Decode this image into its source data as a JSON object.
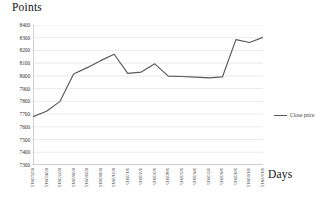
{
  "chart_data": {
    "type": "line",
    "title": "",
    "xlabel": "Days",
    "ylabel": "Points",
    "ylim": [
      7300,
      8400
    ],
    "ytick_step": 100,
    "yticks": [
      8400,
      8300,
      8200,
      8100,
      8000,
      7900,
      7800,
      7700,
      7600,
      7500,
      7400,
      7300
    ],
    "grid": true,
    "grid_axis": "y",
    "legend_position": "right",
    "categories": [
      "8/25/2015",
      "8/26/2015",
      "8/27/2015",
      "8/28/2015",
      "8/29/2015",
      "8/30/2015",
      "8/31/2015",
      "9/1/2015",
      "9/2/2015",
      "9/3/2015",
      "9/4/2015",
      "9/5/2015",
      "9/6/2015",
      "9/7/2015",
      "9/8/2015",
      "9/9/2015",
      "9/10/2015",
      "9/11/2015"
    ],
    "series": [
      {
        "name": "Close price",
        "color": "#595959",
        "values": [
          7680,
          7722,
          7800,
          8015,
          8065,
          8120,
          8170,
          8020,
          8030,
          8095,
          7998,
          7995,
          7990,
          7985,
          7992,
          8285,
          8262,
          8303
        ]
      }
    ]
  },
  "legend": {
    "entries": [
      {
        "label": "Close price"
      }
    ]
  }
}
